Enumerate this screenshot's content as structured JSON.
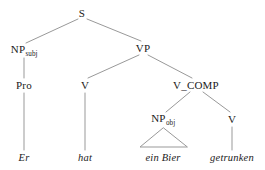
{
  "figure": {
    "type": "syntax-tree",
    "sentence": "Er hat ein Bier getrunken",
    "background_color": "#ffffff",
    "line_color": "#999999",
    "text_color": "#1a1a1a"
  },
  "nodes": {
    "s": {
      "label": "S",
      "x": 82,
      "y": 13
    },
    "np_subj": {
      "label": "NP",
      "subscript": "subj",
      "x": 24,
      "y": 50
    },
    "vp": {
      "label": "VP",
      "x": 143,
      "y": 48
    },
    "pro": {
      "label": "Pro",
      "x": 24,
      "y": 85
    },
    "v_aux": {
      "label": "V",
      "x": 85,
      "y": 85
    },
    "v_comp": {
      "label": "V_COMP",
      "x": 196,
      "y": 85
    },
    "np_obj": {
      "label": "NP",
      "subscript": "obj",
      "x": 163,
      "y": 119
    },
    "v_main": {
      "label": "V",
      "x": 232,
      "y": 119
    }
  },
  "terminals": [
    {
      "text": "Er",
      "x": 24,
      "y": 158
    },
    {
      "text": "hat",
      "x": 85,
      "y": 158
    },
    {
      "text": "ein Bier",
      "x": 163,
      "y": 158
    },
    {
      "text": "getrunken",
      "x": 232,
      "y": 158
    }
  ],
  "edges": [
    {
      "from": "s",
      "to": "np_subj",
      "x1": 78,
      "y1": 19,
      "x2": 26,
      "y2": 43
    },
    {
      "from": "s",
      "to": "vp",
      "x1": 87,
      "y1": 19,
      "x2": 141,
      "y2": 41
    },
    {
      "from": "np_subj",
      "to": "pro",
      "x1": 24,
      "y1": 58,
      "x2": 24,
      "y2": 78
    },
    {
      "from": "vp",
      "to": "v_aux",
      "x1": 139,
      "y1": 55,
      "x2": 88,
      "y2": 78
    },
    {
      "from": "vp",
      "to": "v_comp",
      "x1": 148,
      "y1": 55,
      "x2": 192,
      "y2": 78
    },
    {
      "from": "pro",
      "to": "Er",
      "x1": 24,
      "y1": 93,
      "x2": 24,
      "y2": 150
    },
    {
      "from": "v_aux",
      "to": "hat",
      "x1": 85,
      "y1": 93,
      "x2": 85,
      "y2": 150
    },
    {
      "from": "v_comp",
      "to": "np_obj",
      "x1": 190,
      "y1": 92,
      "x2": 166,
      "y2": 112
    },
    {
      "from": "v_comp",
      "to": "v_main",
      "x1": 203,
      "y1": 92,
      "x2": 230,
      "y2": 112
    },
    {
      "from": "v_main",
      "to": "getrunken",
      "x1": 232,
      "y1": 127,
      "x2": 232,
      "y2": 150
    }
  ],
  "triangle": {
    "covers": "ein Bier",
    "apex_x": 163,
    "apex_y": 128,
    "left_x": 140,
    "right_x": 187,
    "base_y": 147
  }
}
